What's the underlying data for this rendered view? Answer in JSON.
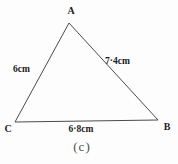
{
  "figure": {
    "type": "triangle-diagram",
    "caption": "(c)",
    "vertices": {
      "A": "A",
      "B": "B",
      "C": "C"
    },
    "sides": {
      "CA": "6cm",
      "AB": "7·4cm",
      "CB": "6·8cm"
    },
    "colors": {
      "line": "#4b4b4b",
      "label": "#1c1c1c",
      "caption": "#4f4f4f",
      "background": "#fdfdfd"
    }
  }
}
